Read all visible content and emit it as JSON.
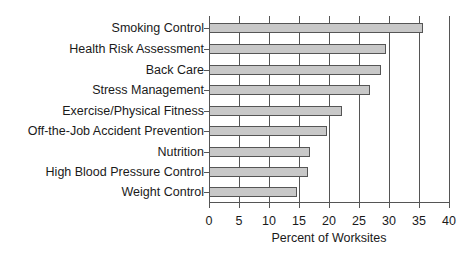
{
  "chart_data": {
    "type": "bar",
    "orientation": "horizontal",
    "title": "",
    "xlabel": "Percent of Worksites",
    "ylabel": "",
    "xlim": [
      0,
      40
    ],
    "xticks": [
      0,
      5,
      10,
      15,
      20,
      25,
      30,
      35,
      40
    ],
    "grid": "vertical",
    "legend": null,
    "categories": [
      "Smoking Control",
      "Health Risk Assessment",
      "Back Care",
      "Stress Management",
      "Exercise/Physical Fitness",
      "Off-the-Job Accident Prevention",
      "Nutrition",
      "High Blood Pressure Control",
      "Weight Control"
    ],
    "values": [
      35.7,
      29.5,
      28.7,
      26.8,
      22.2,
      19.7,
      16.8,
      16.5,
      14.7
    ],
    "bar_color": "#c8c8c8",
    "edge_color": "#555555"
  },
  "axis": {
    "xlabel": "Percent of Worksites",
    "ticks": [
      "0",
      "5",
      "10",
      "15",
      "20",
      "25",
      "30",
      "35",
      "40"
    ]
  }
}
